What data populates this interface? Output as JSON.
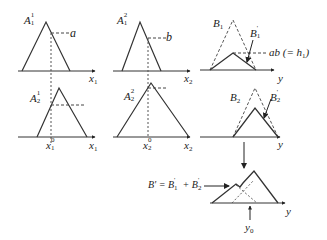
{
  "diagram": {
    "type": "fuzzy-inference-mamdani",
    "colors": {
      "line": "#333333",
      "dashed": "#444444",
      "background": "#ffffff"
    },
    "panels": [
      {
        "id": "A11",
        "label_base": "A",
        "label_sup": "1",
        "label_sub": "1",
        "axis": "x",
        "axis_sub": "1",
        "level_label": "a"
      },
      {
        "id": "A12",
        "label_base": "A",
        "label_sup": "2",
        "label_sub": "1",
        "axis": "x",
        "axis_sub": "2",
        "level_label": "b"
      },
      {
        "id": "B1",
        "label_base": "B",
        "label_sub": "1",
        "clipped_label_base": "B",
        "clipped_label_sup": "'",
        "clipped_label_sub": "1",
        "level_label": "ab (= h",
        "level_label_sub": "1",
        "level_label_end": ")",
        "axis": "y"
      },
      {
        "id": "A21",
        "label_base": "A",
        "label_sup": "1",
        "label_sub": "2",
        "axis": "x",
        "axis_sub": "1",
        "input_base": "x",
        "input_sup": "0",
        "input_sub": "1"
      },
      {
        "id": "A22",
        "label_base": "A",
        "label_sup": "2",
        "label_sub": "2",
        "axis": "x",
        "axis_sub": "2",
        "input_base": "x",
        "input_sup": "0",
        "input_sub": "2"
      },
      {
        "id": "B2",
        "label_base": "B",
        "label_sub": "2",
        "clipped_label_base": "B",
        "clipped_label_sup": "'",
        "clipped_label_sub": "2",
        "axis": "y"
      }
    ],
    "aggregate": {
      "equation_lhs": "B' = B",
      "term1_sup": "'",
      "term1_sub": "1",
      "plus": " + B",
      "term2_sup": "'",
      "term2_sub": "2",
      "axis": "y",
      "output_base": "y",
      "output_sub": "0"
    }
  }
}
